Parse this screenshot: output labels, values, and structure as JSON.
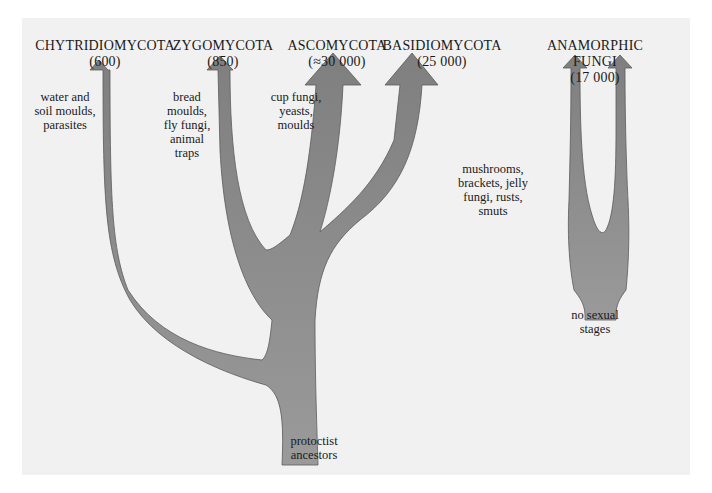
{
  "diagram": {
    "type": "phylogenetic-tree",
    "fill_color": "#8a8a8a",
    "stroke_color": "#555555",
    "background_color": "#f1f1f1",
    "root": {
      "label_lines": [
        "protoctist",
        "ancestors"
      ]
    },
    "groups": [
      {
        "name": "CHYTRIDIOMYCOTA",
        "count": "(600)",
        "description_lines": [
          "water and",
          "soil moulds,",
          "parasites"
        ]
      },
      {
        "name": "ZYGOMYCOTA",
        "count": "(850)",
        "description_lines": [
          "bread",
          "moulds,",
          "fly fungi,",
          "animal",
          "traps"
        ]
      },
      {
        "name": "ASCOMYCOTA",
        "count": "(≈30 000)",
        "description_lines": [
          "cup fungi,",
          "yeasts,",
          "moulds"
        ]
      },
      {
        "name": "BASIDIOMYCOTA",
        "count": "(25 000)",
        "description_lines": [
          "mushrooms,",
          "brackets, jelly",
          "fungi, rusts,",
          "smuts"
        ]
      },
      {
        "name_lines": [
          "ANAMORPHIC",
          "FUNGI"
        ],
        "count": "(17 000)",
        "description_lines": [
          "no sexual",
          "stages"
        ]
      }
    ]
  }
}
